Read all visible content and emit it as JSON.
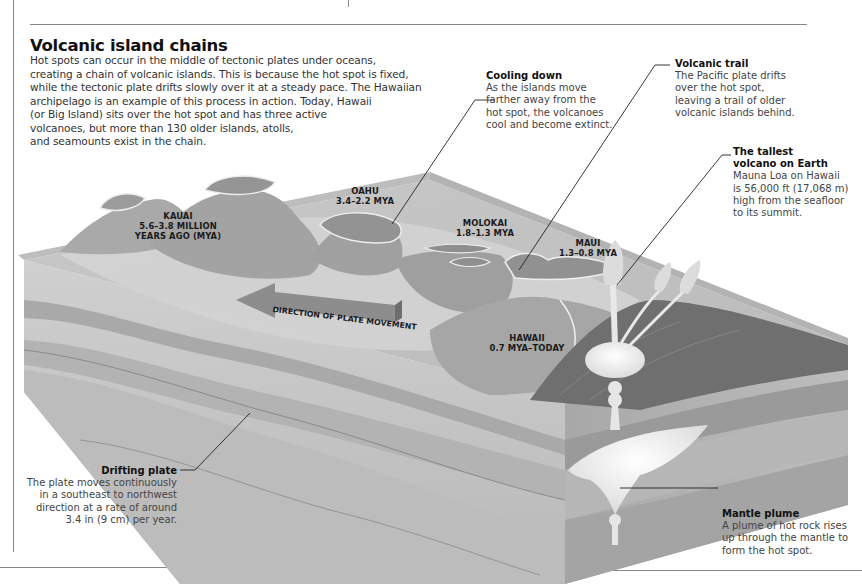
{
  "header": {
    "title": "Volcanic island chains",
    "intro_lines": [
      "Hot spots can occur in the middle of tectonic plates under oceans,",
      "creating a chain of volcanic islands. This is because the hot spot is fixed,",
      "while the tectonic plate drifts slowly over it at a steady pace. The Hawaiian",
      "archipelago is an example of this process in action. Today, Hawaii",
      "(or Big Island) sits over the hot spot and has three active",
      "volcanoes, but more than 130 older islands, atolls,",
      "and seamounts exist in the chain."
    ]
  },
  "callouts": {
    "cooling": {
      "heading": "Cooling down",
      "lines": [
        "As the islands move",
        "farther away from the",
        "hot spot, the volcanoes",
        "cool and become extinct."
      ]
    },
    "trail": {
      "heading": "Volcanic trail",
      "lines": [
        "The Pacific plate drifts",
        "over the hot spot,",
        "leaving a trail of older",
        "volcanic islands behind."
      ]
    },
    "tallest": {
      "heading_lines": [
        "The tallest",
        "volcano on Earth"
      ],
      "lines": [
        "Mauna Loa on Hawaii",
        "is 56,000 ft (17,068 m)",
        "high from the seafloor",
        "to its summit."
      ]
    },
    "drifting": {
      "heading": "Drifting plate",
      "lines": [
        "The plate moves continuously",
        "in a southeast to northwest",
        "direction at a rate of around",
        "3.4 in (9 cm) per year."
      ]
    },
    "plume": {
      "heading": "Mantle plume",
      "lines": [
        "A plume of hot rock rises",
        "up through the mantle to",
        "form the hot spot."
      ]
    }
  },
  "islands": [
    {
      "name": "KAUAI",
      "age_lines": [
        "5.6–3.8 MILLION",
        "YEARS AGO (MYA)"
      ]
    },
    {
      "name": "OAHU",
      "age_lines": [
        "3.4–2.2 MYA"
      ]
    },
    {
      "name": "MOLOKAI",
      "age_lines": [
        "1.8–1.3 MYA"
      ]
    },
    {
      "name": "MAUI",
      "age_lines": [
        "1.3–0.8 MYA"
      ]
    },
    {
      "name": "HAWAII",
      "age_lines": [
        "0.7 MYA–TODAY"
      ]
    }
  ],
  "arrow_label": "DIRECTION OF PLATE MOVEMENT",
  "colors": {
    "rule": "#888888",
    "sea_surface": "#c4c4c4",
    "layer_light": "#d2d2d2",
    "layer_mid": "#b0b0b0",
    "layer_dark": "#8c8c8c",
    "magma": "#f0f0f0"
  }
}
